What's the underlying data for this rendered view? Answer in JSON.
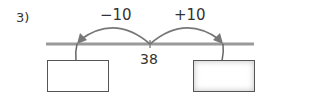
{
  "problem_number": "3",
  "number_line": {
    "center_value": "38",
    "left_jump": "−10",
    "right_jump": "+10"
  },
  "answer_boxes": [
    {
      "position": "left",
      "value": ""
    },
    {
      "position": "right",
      "value": ""
    }
  ],
  "colors": {
    "line": "#999999",
    "arrow": "#777777",
    "text": "#333333"
  }
}
